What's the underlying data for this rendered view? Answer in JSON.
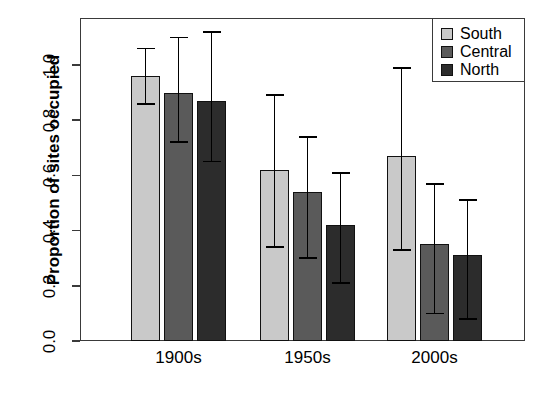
{
  "chart_data": {
    "type": "bar",
    "title": "",
    "subtitle": "",
    "xlabel": "",
    "ylabel": "Proportion of sites occupied",
    "categories": [
      "1900s",
      "1950s",
      "2000s"
    ],
    "ylim": [
      0.0,
      1.2
    ],
    "yticks": [
      "0.0",
      "0.2",
      "0.4",
      "0.6",
      "0.8",
      "1.0"
    ],
    "ytick_values": [
      0.0,
      0.2,
      0.4,
      0.6,
      0.8,
      1.0
    ],
    "grid": false,
    "legend_position": "top-right",
    "error_bars": "asymmetric confidence intervals",
    "series": [
      {
        "name": "South",
        "color": "#c9c9c9",
        "values": [
          0.96,
          0.62,
          0.67
        ],
        "ci_low": [
          0.86,
          0.34,
          0.33
        ],
        "ci_high": [
          1.06,
          0.89,
          0.99
        ]
      },
      {
        "name": "Central",
        "color": "#5a5a5a",
        "values": [
          0.9,
          0.54,
          0.35
        ],
        "ci_low": [
          0.72,
          0.3,
          0.1
        ],
        "ci_high": [
          1.1,
          0.74,
          0.57
        ]
      },
      {
        "name": "North",
        "color": "#2c2c2c",
        "values": [
          0.87,
          0.42,
          0.31
        ],
        "ci_low": [
          0.65,
          0.21,
          0.08
        ],
        "ci_high": [
          1.12,
          0.61,
          0.51
        ]
      }
    ]
  },
  "legend": {
    "items": [
      {
        "label": "South",
        "color": "#c9c9c9"
      },
      {
        "label": "Central",
        "color": "#5a5a5a"
      },
      {
        "label": "North",
        "color": "#2c2c2c"
      }
    ]
  },
  "caption": ""
}
